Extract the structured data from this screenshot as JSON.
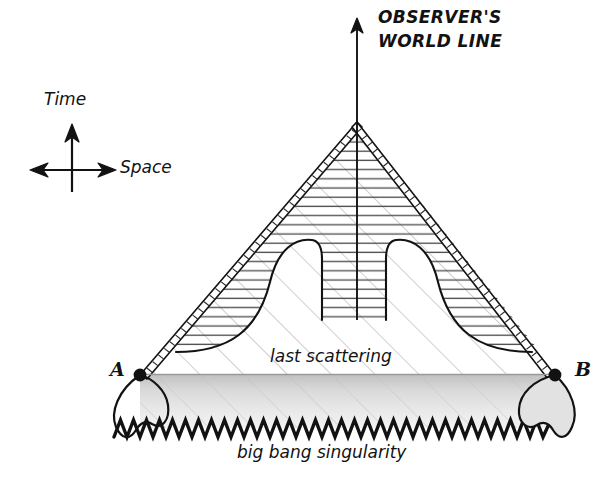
{
  "diagram": {
    "kind": "spacetime-conformal-diagram",
    "background_color": "#ffffff",
    "ink_color": "#121212",
    "light_hatch_color": "#b9b9b9",
    "dense_hatch_color": "#4a4a4a",
    "shade_color": "#d7d7d7",
    "title": {
      "line1": "OBSERVER'S",
      "line2": "WORLD LINE"
    },
    "axis_key": {
      "time_label": "Time",
      "space_label": "Space",
      "time_icon": "up-arrow-icon",
      "space_icon": "double-headed-horizontal-arrow-icon"
    },
    "annotations": {
      "last_scattering": "last scattering",
      "big_bang": "big bang singularity"
    },
    "points": [
      {
        "id": "A",
        "label": "A"
      },
      {
        "id": "B",
        "label": "B"
      }
    ],
    "elements": {
      "world_line": "observers-world-line",
      "past_light_cone": "past-light-cone",
      "particle_horizon_region": "horizon-region",
      "singularity_curve": "zigzag-singularity",
      "last_scattering_surface": "last-scattering-surface"
    }
  },
  "geometry": {
    "apex": {
      "x": 357,
      "y": 122
    },
    "world_line_top": {
      "x": 357,
      "y": 18
    },
    "point_a": {
      "x": 140,
      "y": 375
    },
    "point_b": {
      "x": 555,
      "y": 375
    },
    "singularity_y": 428,
    "last_scattering_y": 374,
    "inner_left_x": 322,
    "inner_right_x": 386,
    "inner_bottom_y": 320,
    "zigzag_period": 13,
    "zigzag_amplitude": 9
  }
}
